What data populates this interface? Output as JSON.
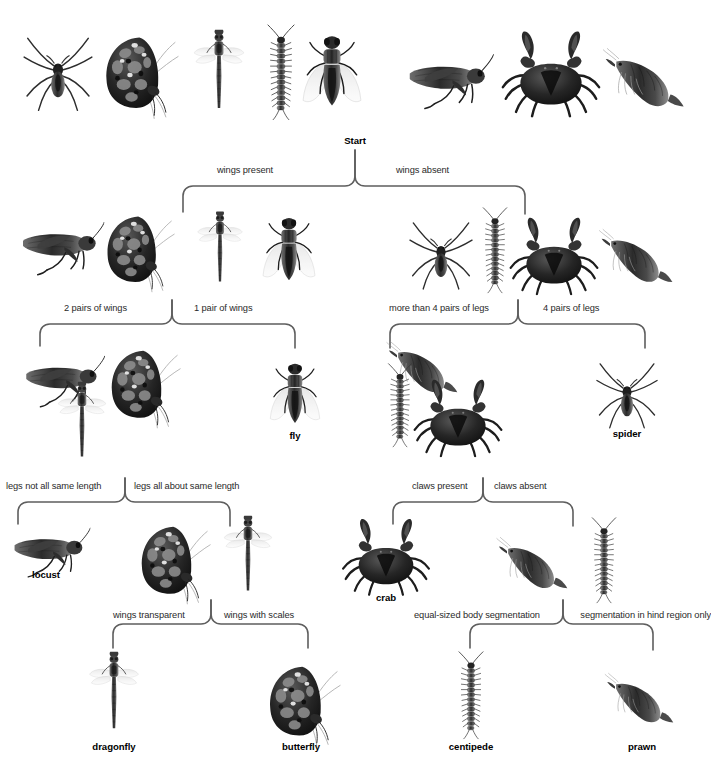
{
  "diagram": {
    "type": "dichotomous-key",
    "title_node": "Start",
    "levels": [
      {
        "level": 0,
        "node": "Start",
        "specimens": [
          "spider",
          "butterfly",
          "dragonfly",
          "centipede",
          "fly",
          "locust",
          "crab",
          "prawn"
        ],
        "branches": [
          {
            "criterion": "wings present",
            "side": "left"
          },
          {
            "criterion": "wings absent",
            "side": "right"
          }
        ]
      },
      {
        "level": 1,
        "left_group": {
          "specimens": [
            "locust",
            "butterfly",
            "dragonfly",
            "fly"
          ],
          "branches": [
            {
              "criterion": "2 pairs of wings",
              "side": "left"
            },
            {
              "criterion": "1 pair of wings",
              "side": "right"
            }
          ]
        },
        "right_group": {
          "specimens": [
            "spider",
            "centipede",
            "crab",
            "prawn"
          ],
          "branches": [
            {
              "criterion": "more than 4 pairs of legs",
              "side": "left"
            },
            {
              "criterion": "4 pairs of legs",
              "side": "right"
            }
          ]
        }
      },
      {
        "level": 2,
        "groups": [
          {
            "specimens": [
              "locust",
              "butterfly",
              "dragonfly"
            ],
            "branches": [
              {
                "criterion": "legs not all same length",
                "side": "left"
              },
              {
                "criterion": "legs all about same length",
                "side": "right"
              }
            ]
          },
          {
            "specimens": [
              "fly"
            ],
            "terminal": "fly"
          },
          {
            "specimens": [
              "centipede",
              "prawn",
              "crab"
            ],
            "branches": [
              {
                "criterion": "claws present",
                "side": "left"
              },
              {
                "criterion": "claws absent",
                "side": "right"
              }
            ]
          },
          {
            "specimens": [
              "spider"
            ],
            "terminal": "spider"
          }
        ]
      },
      {
        "level": 3,
        "groups": [
          {
            "specimens": [
              "locust"
            ],
            "terminal": "locust"
          },
          {
            "specimens": [
              "butterfly",
              "dragonfly"
            ],
            "branches": [
              {
                "criterion": "wings transparent",
                "side": "left"
              },
              {
                "criterion": "wings with scales",
                "side": "right"
              }
            ]
          },
          {
            "specimens": [
              "crab"
            ],
            "terminal": "crab"
          },
          {
            "specimens": [
              "prawn",
              "centipede"
            ],
            "branches": [
              {
                "criterion": "equal-sized body segmentation",
                "side": "left"
              },
              {
                "criterion": "segmentation in hind region only",
                "side": "right"
              }
            ]
          }
        ]
      },
      {
        "level": 4,
        "terminals": [
          "dragonfly",
          "butterfly",
          "centipede",
          "prawn"
        ]
      }
    ],
    "criteria_text": {
      "c0_left": "wings present",
      "c0_right": "wings absent",
      "c1a_left": "2 pairs of wings",
      "c1a_right": "1 pair of wings",
      "c1b_left": "more than 4 pairs of legs",
      "c1b_right": "4 pairs of legs",
      "c2a_left": "legs not all same length",
      "c2a_right": "legs all about same length",
      "c2b_left": "claws present",
      "c2b_right": "claws absent",
      "c3a_left": "wings transparent",
      "c3a_right": "wings with scales",
      "c3b_left": "equal-sized body segmentation",
      "c3b_right": "segmentation in hind region only"
    },
    "terminal_labels": {
      "fly": "fly",
      "spider": "spider",
      "locust": "locust",
      "crab": "crab",
      "dragonfly": "dragonfly",
      "butterfly": "butterfly",
      "centipede": "centipede",
      "prawn": "prawn"
    },
    "colors": {
      "background": "#ffffff",
      "bracket_stroke": "#5e5e5e",
      "criterion_text": "#2a2a2a",
      "label_text": "#000000",
      "artwork": "grayscale"
    }
  }
}
